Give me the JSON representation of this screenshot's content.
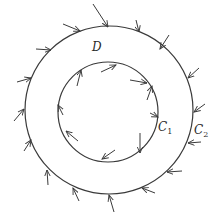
{
  "diagram": {
    "title": "",
    "region_label": "D",
    "inner_curve": {
      "name": "C",
      "subscript": "1",
      "cx": 108,
      "cy": 112,
      "r": 50
    },
    "outer_curve": {
      "name": "C",
      "subscript": "2",
      "cx": 109,
      "cy": 110,
      "r": 84
    },
    "stroke_color": "#3a3a3a",
    "outer_arrows": [
      {
        "x1": 93,
        "y1": 4,
        "x2": 108,
        "y2": 27
      },
      {
        "x1": 136,
        "y1": 20,
        "x2": 139,
        "y2": 32
      },
      {
        "x1": 169,
        "y1": 35,
        "x2": 160,
        "y2": 49
      },
      {
        "x1": 63,
        "y1": 24,
        "x2": 80,
        "y2": 31
      },
      {
        "x1": 36,
        "y1": 49,
        "x2": 51,
        "y2": 50
      },
      {
        "x1": 17,
        "y1": 82,
        "x2": 31,
        "y2": 78
      },
      {
        "x1": 14,
        "y1": 121,
        "x2": 24,
        "y2": 109
      },
      {
        "x1": 24,
        "y1": 151,
        "x2": 31,
        "y2": 140
      },
      {
        "x1": 48,
        "y1": 185,
        "x2": 47,
        "y2": 170
      },
      {
        "x1": 79,
        "y1": 201,
        "x2": 73,
        "y2": 188
      },
      {
        "x1": 114,
        "y1": 212,
        "x2": 109,
        "y2": 195
      },
      {
        "x1": 155,
        "y1": 193,
        "x2": 142,
        "y2": 188
      },
      {
        "x1": 182,
        "y1": 171,
        "x2": 167,
        "y2": 172
      },
      {
        "x1": 201,
        "y1": 142,
        "x2": 188,
        "y2": 143
      },
      {
        "x1": 205,
        "y1": 104,
        "x2": 194,
        "y2": 112
      },
      {
        "x1": 199,
        "y1": 68,
        "x2": 188,
        "y2": 78
      }
    ],
    "inner_arrows": [
      {
        "x1": 101,
        "y1": 72,
        "x2": 116,
        "y2": 65
      },
      {
        "x1": 77,
        "y1": 86,
        "x2": 81,
        "y2": 70
      },
      {
        "x1": 130,
        "y1": 80,
        "x2": 147,
        "y2": 83
      },
      {
        "x1": 63,
        "y1": 115,
        "x2": 58,
        "y2": 105
      },
      {
        "x1": 78,
        "y1": 141,
        "x2": 66,
        "y2": 131
      },
      {
        "x1": 115,
        "y1": 150,
        "x2": 102,
        "y2": 159
      },
      {
        "x1": 140,
        "y1": 133,
        "x2": 140,
        "y2": 153
      },
      {
        "x1": 150,
        "y1": 113,
        "x2": 158,
        "y2": 117
      },
      {
        "x1": 147,
        "y1": 100,
        "x2": 152,
        "y2": 86
      }
    ]
  }
}
